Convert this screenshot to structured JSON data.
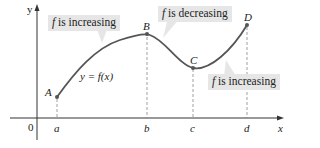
{
  "diagram": {
    "axes": {
      "x_label": "x",
      "y_label": "y",
      "origin_label": "0"
    },
    "curve_label": "y = f(x)",
    "points": [
      {
        "name": "A",
        "tick": "a"
      },
      {
        "name": "B",
        "tick": "b"
      },
      {
        "name": "C",
        "tick": "c"
      },
      {
        "name": "D",
        "tick": "d"
      }
    ],
    "callouts": [
      {
        "f": "f",
        "text": " is increasing"
      },
      {
        "f": "f",
        "text": " is decreasing"
      },
      {
        "f": "f",
        "text": " is increasing"
      }
    ],
    "colors": {
      "curve": "#555555",
      "callout_bg": "#e6e6e6",
      "axis": "#333333",
      "dashed": "#888888"
    }
  }
}
